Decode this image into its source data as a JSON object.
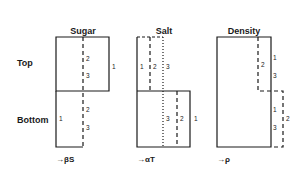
{
  "columns": [
    {
      "title": "Sugar",
      "axis": "→βS"
    },
    {
      "title": "Salt",
      "axis": "→αT"
    },
    {
      "title": "Density",
      "axis": "→ρ"
    }
  ],
  "rows": [
    "Top",
    "Bottom"
  ],
  "line_labels": {
    "sugar": {
      "top": [
        "2",
        "3",
        "1"
      ],
      "bottom": [
        "1",
        "2",
        "3"
      ]
    },
    "salt": {
      "top": [
        "1",
        "2",
        "3"
      ],
      "bottom": [
        "3",
        "2",
        "1"
      ]
    },
    "density": {
      "top": [
        "2",
        "1",
        "3"
      ],
      "bottom": [
        "1",
        "3",
        "2"
      ]
    }
  },
  "legend": {
    "1": "solid line",
    "2": "dashed line",
    "3": "dotted line"
  },
  "colors": {
    "line": "#1a1a1a",
    "background": "#ffffff"
  }
}
